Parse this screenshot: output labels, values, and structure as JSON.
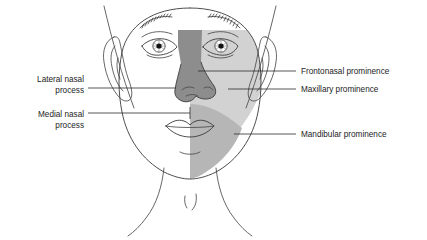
{
  "colors": {
    "frontonasal": "#8d8d8d",
    "maxillary": "#d2d2d2",
    "mandibular": "#b6b6b6",
    "outline": "#4a4a4a",
    "leader": "#2b2b2b",
    "text": "#1b1b1b",
    "background": "#ffffff"
  },
  "labels": {
    "left": [
      {
        "id": "lateral-nasal-process",
        "line1": "Lateral nasal",
        "line2": "process"
      },
      {
        "id": "medial-nasal-process",
        "line1": "Medial nasal",
        "line2": "process"
      }
    ],
    "right": [
      {
        "id": "frontonasal-prominence",
        "text": "Frontonasal prominence"
      },
      {
        "id": "maxillary-prominence",
        "text": "Maxillary prominence"
      },
      {
        "id": "mandibular-prominence",
        "text": "Mandibular prominence"
      }
    ]
  }
}
